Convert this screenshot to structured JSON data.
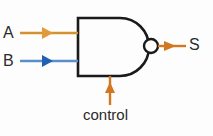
{
  "diagram": {
    "type": "logic-gate-schematic",
    "gate": {
      "name": "nand-gate",
      "shape": "and-body-with-inversion-bubble",
      "body_stroke": "#1a1a1a",
      "bubble": {
        "name": "inversion-bubble",
        "cx": 151,
        "cy": 46,
        "r": 7
      }
    },
    "background_color": "#fdfdfd",
    "text_color": "#2b2b2b"
  },
  "signals": {
    "input_a": {
      "label": "A",
      "color": "#d2922f",
      "direction": "right",
      "from": {
        "x": 20,
        "y": 33
      },
      "to": {
        "x": 78,
        "y": 33
      }
    },
    "input_b": {
      "label": "B",
      "color": "#3d79c0",
      "direction": "right",
      "from": {
        "x": 20,
        "y": 61
      },
      "to": {
        "x": 78,
        "y": 61
      }
    },
    "control": {
      "label": "control",
      "color": "#d2771f",
      "direction": "up",
      "from": {
        "x": 110,
        "y": 104
      },
      "to": {
        "x": 110,
        "y": 76
      }
    },
    "output_s": {
      "label": "S",
      "color": "#d2771f",
      "direction": "right",
      "from": {
        "x": 158,
        "y": 46
      },
      "to": {
        "x": 186,
        "y": 46
      }
    }
  }
}
